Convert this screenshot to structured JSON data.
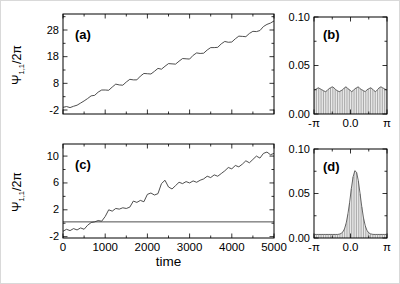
{
  "figure": {
    "background": "#ffffff",
    "frame_color": "#000000",
    "trace_color": "#3a3a3a",
    "bar_color": "#929292",
    "envelope_color": "#555555"
  },
  "chart_data": [
    {
      "id": "a",
      "type": "line",
      "panel_label": "(a)",
      "xlim": [
        0,
        5000
      ],
      "ylim": [
        -3.5,
        34
      ],
      "grid": false,
      "xticks": {
        "values": [
          0,
          1000,
          2000,
          3000,
          4000,
          5000
        ],
        "minor": [
          500,
          1500,
          2500,
          3500,
          4500
        ],
        "labels": null
      },
      "yticks": {
        "values": [
          -2,
          8,
          18,
          28
        ],
        "minor": [
          3,
          13,
          23,
          33
        ],
        "labels": [
          "-2",
          "8",
          "18",
          "28"
        ]
      },
      "ylabel_psi": "Ψ",
      "ylabel_sub": "1,1",
      "ylabel_rest": "/2π",
      "series": [
        {
          "name": "phase-winding-trace-a",
          "y": [
            -1.0,
            -0.7,
            -1.1,
            -0.6,
            -0.2,
            0.6,
            1.4,
            2.3,
            3.3,
            3.5,
            4.7,
            5.5,
            5.5,
            5.4,
            6.6,
            7.7,
            7.4,
            7.3,
            8.5,
            9.5,
            9.3,
            9.3,
            10.7,
            11.7,
            11.6,
            11.5,
            12.5,
            13.6,
            13.3,
            14.4,
            15.4,
            15.3,
            15.2,
            16.3,
            17.3,
            17.2,
            17.1,
            18.5,
            19.4,
            19.2,
            19.3,
            20.5,
            21.4,
            21.4,
            21.5,
            22.8,
            23.7,
            23.4,
            23.5,
            24.7,
            25.7,
            25.6,
            25.5,
            26.7,
            27.5,
            27.4,
            27.8,
            29.3,
            30.1,
            30.6,
            31.4
          ]
        }
      ]
    },
    {
      "id": "b",
      "type": "comb",
      "panel_label": "(b)",
      "xlim": [
        -3.1416,
        3.1416
      ],
      "ylim": [
        0,
        0.1
      ],
      "grid": false,
      "xticks": {
        "values": [
          -3.1416,
          0,
          3.1416
        ],
        "minor": [
          -1.5708,
          1.5708
        ],
        "labels": [
          "-π",
          "0.0",
          "π"
        ]
      },
      "yticks": {
        "values": [
          0,
          0.05,
          0.1
        ],
        "minor": [
          0.025,
          0.075
        ],
        "labels": [
          "0.00",
          "0.05",
          "0.10"
        ]
      },
      "bars": [
        0.025,
        0.026,
        0.027,
        0.026,
        0.025,
        0.024,
        0.023,
        0.024,
        0.026,
        0.027,
        0.028,
        0.027,
        0.025,
        0.024,
        0.023,
        0.024,
        0.025,
        0.027,
        0.028,
        0.026,
        0.025,
        0.023,
        0.024,
        0.026,
        0.027,
        0.028,
        0.026,
        0.025,
        0.024,
        0.023,
        0.025,
        0.026,
        0.027,
        0.026,
        0.024,
        0.023,
        0.025,
        0.027,
        0.028,
        0.027,
        0.026,
        0.025
      ]
    },
    {
      "id": "c",
      "type": "line",
      "panel_label": "(c)",
      "xlabel": "time",
      "xlim": [
        0,
        5000
      ],
      "ylim": [
        -2.2,
        11.8
      ],
      "grid": false,
      "xticks": {
        "values": [
          0,
          1000,
          2000,
          3000,
          4000,
          5000
        ],
        "minor": [
          500,
          1500,
          2500,
          3500,
          4500
        ],
        "labels": [
          "0",
          "1000",
          "2000",
          "3000",
          "4000",
          "5000"
        ]
      },
      "yticks": {
        "values": [
          -2,
          2,
          6,
          10
        ],
        "minor": [
          0,
          4,
          8
        ],
        "labels": [
          "-2",
          "2",
          "6",
          "10"
        ]
      },
      "ylabel_psi": "Ψ",
      "ylabel_sub": "1,1",
      "ylabel_rest": "/2π",
      "series": [
        {
          "name": "phase-winding-trace-c",
          "y": [
            -1.2,
            -0.9,
            -1.1,
            -0.8,
            -1.0,
            -0.7,
            -0.9,
            -0.3,
            0.1,
            0.2,
            0.4,
            0.3,
            1.0,
            2.0,
            1.8,
            2.2,
            2.1,
            2.3,
            2.2,
            2.4,
            3.3,
            3.1,
            3.4,
            3.2,
            4.3,
            4.5,
            4.2,
            4.4,
            5.9,
            6.4,
            5.4,
            5.1,
            5.6,
            6.1,
            5.9,
            6.2,
            6.0,
            6.3,
            6.1,
            6.4,
            6.6,
            7.0,
            6.8,
            7.2,
            7.0,
            7.4,
            7.8,
            8.3,
            8.1,
            8.6,
            8.4,
            8.8,
            9.3,
            9.0,
            9.5,
            10.0,
            9.7,
            10.4,
            10.6,
            10.2,
            10.4
          ]
        },
        {
          "name": "locked-phase-trace-c",
          "y": [
            0.2,
            0.2
          ]
        }
      ]
    },
    {
      "id": "d",
      "type": "comb",
      "panel_label": "(d)",
      "xlim": [
        -3.1416,
        3.1416
      ],
      "ylim": [
        0,
        0.1
      ],
      "grid": false,
      "xticks": {
        "values": [
          -3.1416,
          0,
          3.1416
        ],
        "minor": [
          -1.5708,
          1.5708
        ],
        "labels": [
          "-π",
          "0.0",
          "π"
        ]
      },
      "yticks": {
        "values": [
          0,
          0.05,
          0.1
        ],
        "minor": [
          0.025,
          0.075
        ],
        "labels": [
          "0.00",
          "0.05",
          "0.10"
        ]
      },
      "bars": [
        0.004,
        0.004,
        0.004,
        0.004,
        0.004,
        0.004,
        0.004,
        0.004,
        0.004,
        0.004,
        0.004,
        0.004,
        0.004,
        0.004,
        0.0043,
        0.005,
        0.0066,
        0.01,
        0.0165,
        0.0268,
        0.04,
        0.0557,
        0.0687,
        0.0756,
        0.0738,
        0.0643,
        0.0499,
        0.0348,
        0.0223,
        0.0136,
        0.0084,
        0.0058,
        0.0047,
        0.0042,
        0.004,
        0.004,
        0.004,
        0.004,
        0.004,
        0.004,
        0.004,
        0.004
      ]
    }
  ]
}
